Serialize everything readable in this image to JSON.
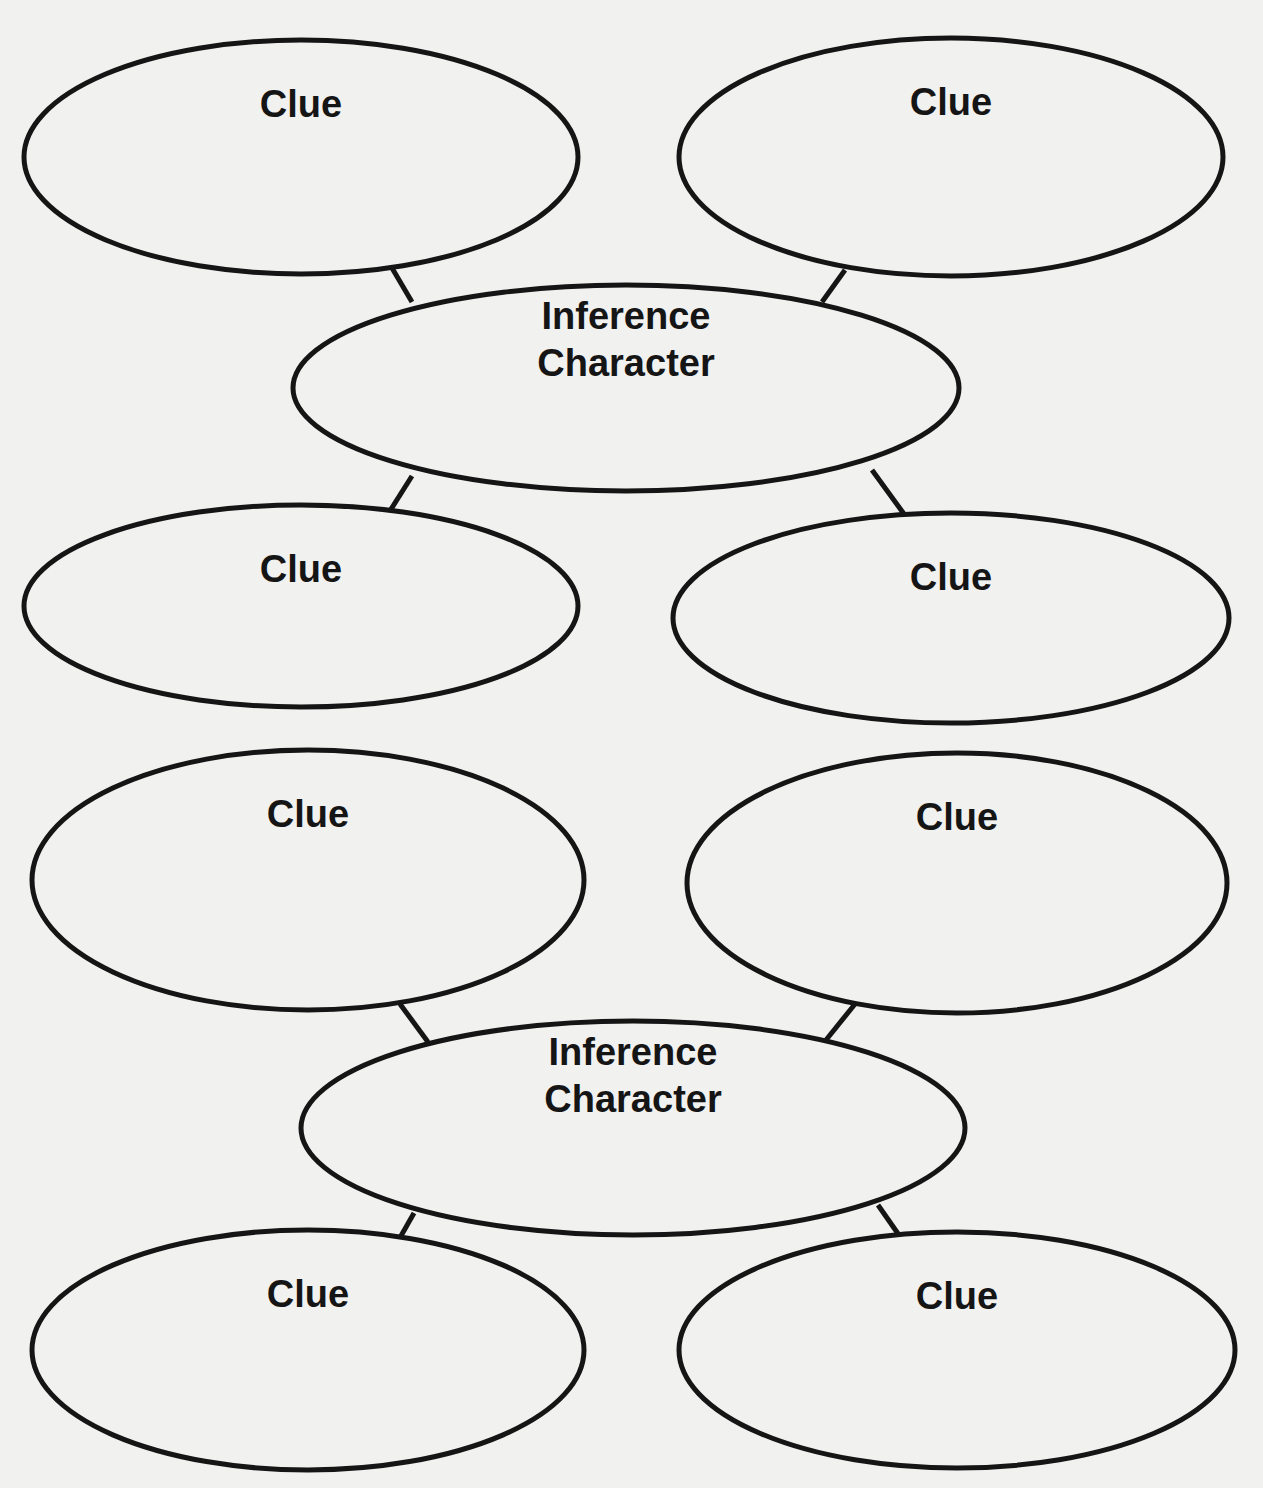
{
  "diagram": {
    "colors": {
      "background": "#f1f1f0",
      "stroke": "#151515",
      "text": "#151515"
    },
    "groups": [
      {
        "inference": {
          "line1": "Inference",
          "line2": "Character",
          "cx": 626,
          "cy": 388,
          "rx": 333,
          "ry": 103
        },
        "clues": [
          {
            "label": "Clue",
            "cx": 301,
            "cy": 157,
            "rx": 277,
            "ry": 117
          },
          {
            "label": "Clue",
            "cx": 951,
            "cy": 157,
            "rx": 272,
            "ry": 119
          },
          {
            "label": "Clue",
            "cx": 301,
            "cy": 606,
            "rx": 277,
            "ry": 101
          },
          {
            "label": "Clue",
            "cx": 951,
            "cy": 618,
            "rx": 278,
            "ry": 105
          }
        ]
      },
      {
        "inference": {
          "line1": "Inference",
          "line2": "Character",
          "cx": 633,
          "cy": 1128,
          "rx": 332,
          "ry": 107
        },
        "clues": [
          {
            "label": "Clue",
            "cx": 308,
            "cy": 880,
            "rx": 276,
            "ry": 130
          },
          {
            "label": "Clue",
            "cx": 957,
            "cy": 883,
            "rx": 270,
            "ry": 130
          },
          {
            "label": "Clue",
            "cx": 308,
            "cy": 1350,
            "rx": 276,
            "ry": 120
          },
          {
            "label": "Clue",
            "cx": 957,
            "cy": 1350,
            "rx": 278,
            "ry": 118
          }
        ]
      }
    ]
  }
}
